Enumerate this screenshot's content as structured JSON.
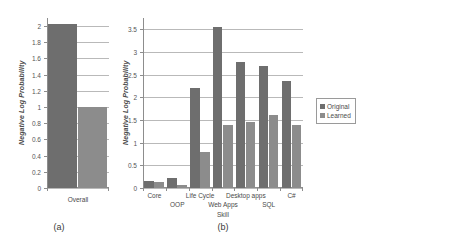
{
  "figure": {
    "background": "#ffffff",
    "colors": {
      "original": "#6e6e6e",
      "learned": "#8c8c8c",
      "gridline": "#b9b9b9",
      "axis": "#8d8d8d",
      "text": "#4a4a4a"
    }
  },
  "panel_a": {
    "caption": "(a)",
    "ylabel": "Negative Log Probability",
    "category": "Overall",
    "yticks": [
      "0",
      "0.2",
      "0.4",
      "0.6",
      "0.8",
      "1",
      "1.2",
      "1.4",
      "1.6",
      "1.8",
      "2"
    ]
  },
  "panel_b": {
    "caption": "(b)",
    "ylabel": "Negative Log Probability",
    "xlabel": "Skill",
    "yticks": [
      "0",
      "0.5",
      "1",
      "1.5",
      "2",
      "2.5",
      "3",
      "3.5"
    ],
    "legend": {
      "original": "Original",
      "learned": "Learned"
    }
  },
  "chart_data": [
    {
      "type": "bar",
      "id": "panel-a",
      "title": "(a)",
      "xlabel": "",
      "ylabel": "Negative Log Probability",
      "categories": [
        "Overall"
      ],
      "series": [
        {
          "name": "Original",
          "values": [
            2.03
          ]
        },
        {
          "name": "Learned",
          "values": [
            1.0
          ]
        }
      ],
      "ylim": [
        0,
        2.1
      ],
      "ytick_values": [
        0,
        0.2,
        0.4,
        0.6,
        0.8,
        1.0,
        1.2,
        1.4,
        1.6,
        1.8,
        2.0
      ],
      "grid": true,
      "legend_position": "none"
    },
    {
      "type": "bar",
      "id": "panel-b",
      "title": "(b)",
      "xlabel": "Skill",
      "ylabel": "Negative Log Probability",
      "categories": [
        "Core",
        "OOP",
        "Life Cycle",
        "Web Apps",
        "Desktop apps",
        "SQL",
        "C#"
      ],
      "series": [
        {
          "name": "Original",
          "values": [
            0.15,
            0.22,
            2.2,
            3.55,
            2.78,
            2.7,
            2.35
          ]
        },
        {
          "name": "Learned",
          "values": [
            0.14,
            0.07,
            0.8,
            1.4,
            1.45,
            1.6,
            1.4
          ]
        }
      ],
      "ylim": [
        0,
        3.75
      ],
      "ytick_values": [
        0,
        0.5,
        1.0,
        1.5,
        2.0,
        2.5,
        3.0,
        3.5
      ],
      "grid": true,
      "legend_position": "right"
    }
  ]
}
